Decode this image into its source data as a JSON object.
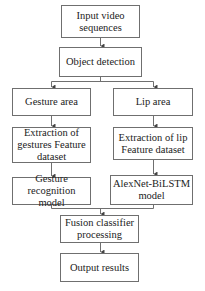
{
  "diagram": {
    "type": "flowchart",
    "nodes": {
      "input": "Input video sequences",
      "object_detection": "Object detection",
      "gesture_area": "Gesture area",
      "lip_area": "Lip area",
      "gesture_extraction": "Extraction of gestures Feature dataset",
      "lip_extraction": "Extraction of lip Feature dataset",
      "gesture_model": "Gesture recognition model",
      "lip_model": "AlexNet-BiLSTM model",
      "fusion": "Fusion classifier processing",
      "output": "Output results"
    },
    "edges": [
      [
        "input",
        "object_detection"
      ],
      [
        "object_detection",
        "gesture_area"
      ],
      [
        "object_detection",
        "lip_area"
      ],
      [
        "gesture_area",
        "gesture_extraction"
      ],
      [
        "lip_area",
        "lip_extraction"
      ],
      [
        "gesture_extraction",
        "gesture_model"
      ],
      [
        "lip_extraction",
        "lip_model"
      ],
      [
        "gesture_model",
        "fusion"
      ],
      [
        "lip_model",
        "fusion"
      ],
      [
        "fusion",
        "output"
      ]
    ],
    "colors": {
      "line": "#6f6f6f",
      "text": "#222222",
      "background": "#ffffff"
    }
  }
}
